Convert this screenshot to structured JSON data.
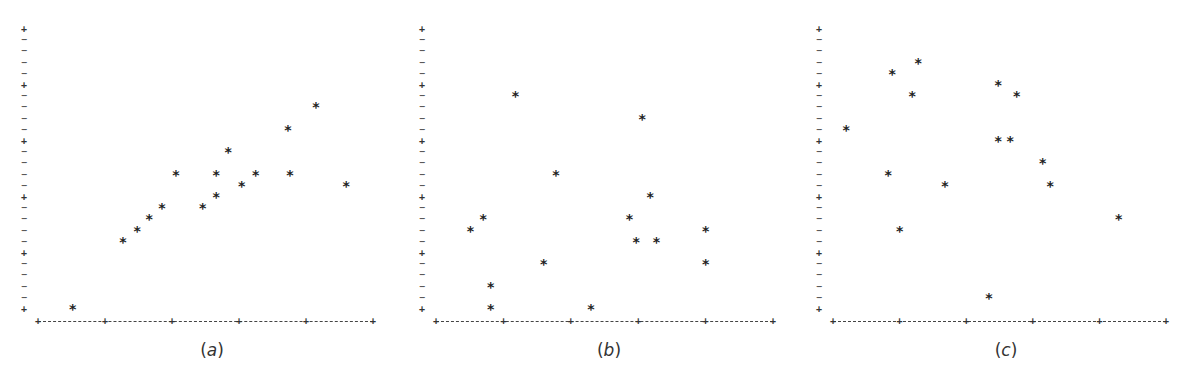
{
  "chart_data": [
    {
      "type": "scatter",
      "title": "",
      "caption": "(a)",
      "caption_letter": "a",
      "xlabel": "",
      "ylabel": "",
      "marker": "*",
      "xlim": [
        0,
        5
      ],
      "ylim": [
        0,
        25
      ],
      "x_major_ticks": [
        0,
        1,
        2,
        3,
        4,
        5
      ],
      "y_major_ticks": [
        0,
        5,
        10,
        15,
        20,
        25
      ],
      "grid": false,
      "points": [
        {
          "x": 0.52,
          "y": 0
        },
        {
          "x": 1.27,
          "y": 6
        },
        {
          "x": 1.48,
          "y": 7
        },
        {
          "x": 1.66,
          "y": 8
        },
        {
          "x": 1.85,
          "y": 9
        },
        {
          "x": 2.06,
          "y": 12
        },
        {
          "x": 2.46,
          "y": 9
        },
        {
          "x": 2.66,
          "y": 10
        },
        {
          "x": 2.66,
          "y": 12
        },
        {
          "x": 2.84,
          "y": 14
        },
        {
          "x": 3.04,
          "y": 11
        },
        {
          "x": 3.25,
          "y": 12
        },
        {
          "x": 3.73,
          "y": 16
        },
        {
          "x": 3.76,
          "y": 12
        },
        {
          "x": 4.15,
          "y": 18
        },
        {
          "x": 4.6,
          "y": 11
        }
      ]
    },
    {
      "type": "scatter",
      "title": "",
      "caption": "(b)",
      "caption_letter": "b",
      "xlabel": "",
      "ylabel": "",
      "marker": "*",
      "xlim": [
        0,
        5
      ],
      "ylim": [
        0,
        25
      ],
      "x_major_ticks": [
        0,
        1,
        2,
        3,
        4,
        5
      ],
      "y_major_ticks": [
        0,
        5,
        10,
        15,
        20,
        25
      ],
      "grid": false,
      "points": [
        {
          "x": 0.51,
          "y": 7
        },
        {
          "x": 0.7,
          "y": 8
        },
        {
          "x": 0.81,
          "y": 2
        },
        {
          "x": 0.81,
          "y": 0
        },
        {
          "x": 1.18,
          "y": 19
        },
        {
          "x": 1.6,
          "y": 4
        },
        {
          "x": 1.78,
          "y": 12
        },
        {
          "x": 2.3,
          "y": 0
        },
        {
          "x": 2.87,
          "y": 8
        },
        {
          "x": 2.97,
          "y": 6
        },
        {
          "x": 3.06,
          "y": 17
        },
        {
          "x": 3.18,
          "y": 10
        },
        {
          "x": 3.27,
          "y": 6
        },
        {
          "x": 4.0,
          "y": 7
        },
        {
          "x": 4.0,
          "y": 4
        }
      ]
    },
    {
      "type": "scatter",
      "title": "",
      "caption": "(c)",
      "caption_letter": "c",
      "xlabel": "",
      "ylabel": "",
      "marker": "*",
      "xlim": [
        0,
        5
      ],
      "ylim": [
        0,
        25
      ],
      "x_major_ticks": [
        0,
        1,
        2,
        3,
        4,
        5
      ],
      "y_major_ticks": [
        0,
        5,
        10,
        15,
        20,
        25
      ],
      "grid": false,
      "points": [
        {
          "x": 0.2,
          "y": 16
        },
        {
          "x": 0.83,
          "y": 12
        },
        {
          "x": 0.89,
          "y": 21
        },
        {
          "x": 1.0,
          "y": 7
        },
        {
          "x": 1.19,
          "y": 19
        },
        {
          "x": 1.28,
          "y": 22
        },
        {
          "x": 1.68,
          "y": 11
        },
        {
          "x": 2.34,
          "y": 1
        },
        {
          "x": 2.48,
          "y": 20
        },
        {
          "x": 2.48,
          "y": 15
        },
        {
          "x": 2.66,
          "y": 15
        },
        {
          "x": 2.76,
          "y": 19
        },
        {
          "x": 3.15,
          "y": 13
        },
        {
          "x": 3.26,
          "y": 11
        },
        {
          "x": 4.29,
          "y": 8
        }
      ]
    }
  ],
  "layout": {
    "panels": [
      {
        "yaxis_x": 24,
        "x0": 38,
        "xstep": 67,
        "caption_x": 212
      },
      {
        "yaxis_x": 422,
        "x0": 436,
        "xstep": 67.4,
        "caption_x": 609
      },
      {
        "yaxis_x": 819,
        "x0": 833,
        "xstep": 66.6,
        "caption_x": 1006
      }
    ],
    "y0": 309,
    "ystep": 11.2,
    "xaxis_y": 321,
    "caption_y": 350
  },
  "glyphs": {
    "major_tick": "+",
    "minor_tick": "−",
    "marker": "*"
  }
}
